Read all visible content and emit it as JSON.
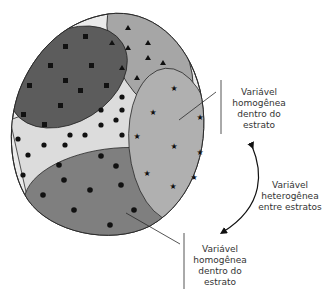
{
  "diagram": {
    "colors": {
      "background": "#ffffff",
      "population_fill": "#ebebeb",
      "squares_stratum": "#5c5c5c",
      "triangles_stratum": "#a6a6a6",
      "pentagons_stratum": "#dcdcdc",
      "stars_stratum": "#b0b0b0",
      "circles_stratum": "#7f7f7f",
      "outline": "#2a2a2a",
      "marker": "#111111"
    },
    "strata": [
      {
        "name": "squares",
        "marker": "square",
        "count": 11
      },
      {
        "name": "triangles",
        "marker": "triangle",
        "count": 9
      },
      {
        "name": "pentagons",
        "marker": "pentagon",
        "count": 16
      },
      {
        "name": "stars",
        "marker": "star",
        "count": 10
      },
      {
        "name": "circles",
        "marker": "circle",
        "count": 12
      }
    ],
    "labels": {
      "top_right": [
        "Variável",
        "homogênea",
        "dentro do",
        "estrato"
      ],
      "middle_right": [
        "Variável",
        "heterogênea",
        "entre estratos"
      ],
      "bottom": [
        "Variável",
        "homogênea",
        "dentro do",
        "estrato"
      ]
    }
  }
}
